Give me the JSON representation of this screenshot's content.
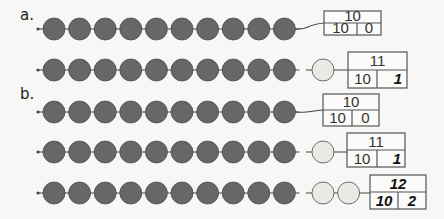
{
  "colors": {
    "dark_bead": "#676767",
    "dark_bead_stroke": "#4a4a4a",
    "light_bead": "#e9e9e6",
    "light_bead_stroke": "#6d6d6d",
    "string": "#444444",
    "box_stroke": "#555555",
    "background": "#f7f7f5"
  },
  "sections": [
    {
      "label": "a.",
      "label_pos": [
        20,
        20
      ],
      "rows": [
        {
          "y": 29,
          "dark_count": 10,
          "light_count": 0,
          "box": {
            "x": 324,
            "y": 11,
            "w": 57,
            "h": 24,
            "divider_x": 357,
            "total": "10",
            "tens": "10",
            "ones": "0",
            "total_style": "",
            "tens_style": "",
            "ones_style": ""
          }
        },
        {
          "y": 70,
          "dark_count": 10,
          "light_count": 1,
          "box": {
            "x": 348,
            "y": 52,
            "w": 59,
            "h": 36,
            "divider_x": 377,
            "total": "11",
            "tens": "10",
            "ones": "1",
            "total_style": "",
            "tens_style": "",
            "ones_style": "bi"
          }
        }
      ]
    },
    {
      "label": "b.",
      "label_pos": [
        20,
        99
      ],
      "rows": [
        {
          "y": 112,
          "dark_count": 10,
          "light_count": 0,
          "box": {
            "x": 323,
            "y": 94,
            "w": 56,
            "h": 32,
            "divider_x": 352,
            "total": "10",
            "tens": "10",
            "ones": "0",
            "total_style": "",
            "tens_style": "",
            "ones_style": ""
          }
        },
        {
          "y": 152,
          "dark_count": 10,
          "light_count": 1,
          "box": {
            "x": 347,
            "y": 133,
            "w": 58,
            "h": 34,
            "divider_x": 377,
            "total": "11",
            "tens": "10",
            "ones": "1",
            "total_style": "",
            "tens_style": "",
            "ones_style": "bi"
          }
        },
        {
          "y": 193,
          "dark_count": 10,
          "light_count": 2,
          "box": {
            "x": 370,
            "y": 175,
            "w": 56,
            "h": 34,
            "divider_x": 398,
            "total": "12",
            "tens": "10",
            "ones": "2",
            "total_style": "bi",
            "tens_style": "bi",
            "ones_style": "bi"
          }
        }
      ]
    }
  ],
  "bead_layout": {
    "start_x": 54,
    "spacing": 25.6,
    "radius": 11,
    "light_start_x": 323
  }
}
